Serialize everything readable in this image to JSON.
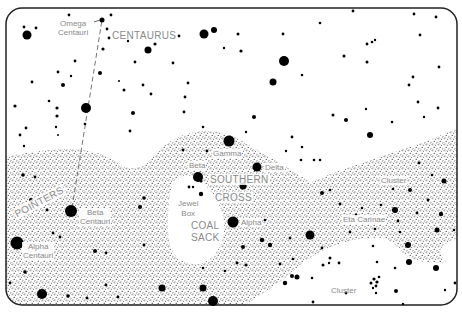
{
  "chart": {
    "constellation_labels": {
      "centaurus": "CENTAURUS",
      "southern_cross_1": "SOUTHERN",
      "southern_cross_2": "CROSS",
      "coal_sack_1": "COAL",
      "coal_sack_2": "SACK",
      "pointers": "POINTERS"
    },
    "star_labels": {
      "omega_centauri_1": "Omega",
      "omega_centauri_2": "Centauri",
      "beta_centauri_1": "Beta",
      "beta_centauri_2": "Centauri",
      "alpha_centauri_1": "Alpha",
      "alpha_centauri_2": "Centauri",
      "gamma": "Gamma",
      "beta": "Beta",
      "delta": "Delta",
      "alpha": "Alpha",
      "jewel_box_1": "Jewel",
      "jewel_box_2": "Box",
      "eta_carinae": "Eta Carinae",
      "cluster_upper": "Cluster",
      "cluster_lower": "Cluster"
    },
    "colors": {
      "star": "#000000",
      "label": "#8a8a8a",
      "milky_way": "#555555",
      "border": "#222222",
      "background": "#ffffff"
    }
  }
}
